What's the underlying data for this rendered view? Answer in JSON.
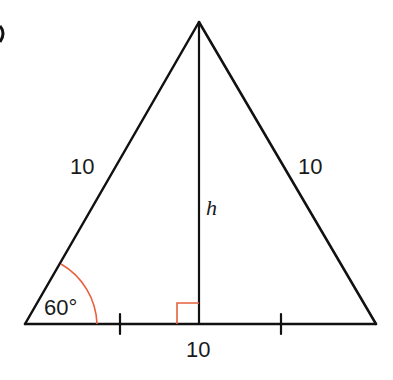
{
  "figure": {
    "part_marker": ")",
    "shape": "equilateral-triangle-with-altitude",
    "labels": {
      "left_side": "10",
      "right_side": "10",
      "base": "10",
      "altitude": "h",
      "angle": "60°"
    },
    "colors": {
      "lines": "#111111",
      "angle_marks": "#e8603c"
    }
  }
}
